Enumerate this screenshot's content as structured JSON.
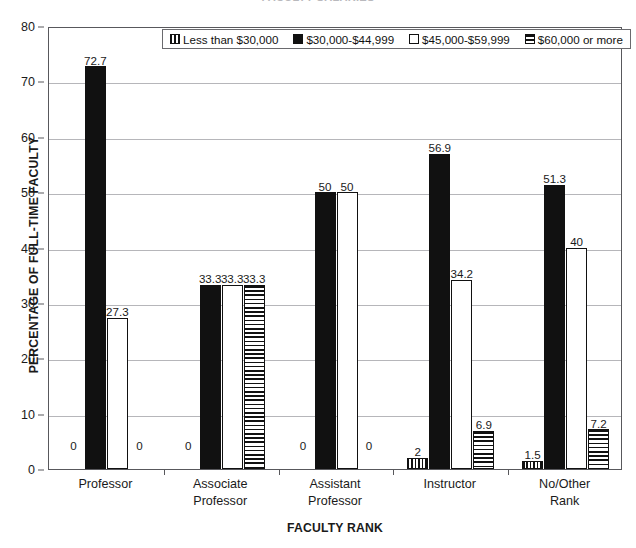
{
  "chart_data": {
    "type": "bar",
    "title": "FACULTY SALARIES",
    "xlabel": "FACULTY RANK",
    "ylabel": "PERCENTAGE OF FULL-TIME FACULTY",
    "ylim": [
      0,
      80
    ],
    "ytick_step": 10,
    "yticks": [
      0,
      10,
      20,
      30,
      40,
      50,
      60,
      70,
      80
    ],
    "grid": true,
    "legend_position": "top-inside",
    "categories": [
      "Professor",
      "Associate Professor",
      "Assistant Professor",
      "Instructor",
      "No/Other Rank"
    ],
    "category_lines": [
      [
        "Professor"
      ],
      [
        "Associate",
        "Professor"
      ],
      [
        "Assistant",
        "Professor"
      ],
      [
        "Instructor"
      ],
      [
        "No/Other",
        "Rank"
      ]
    ],
    "series": [
      {
        "name": "Less than $30,000",
        "pattern": "vertical-stripes",
        "color": "#111111",
        "values": [
          0,
          0,
          0,
          2,
          1.5
        ],
        "labels": [
          "0",
          "0",
          "0",
          "2",
          "1.5"
        ]
      },
      {
        "name": "$30,000-$44,999",
        "pattern": "solid-black",
        "color": "#111111",
        "values": [
          72.7,
          33.3,
          50,
          56.9,
          51.3
        ],
        "labels": [
          "72.7",
          "33.3",
          "50",
          "56.9",
          "51.3"
        ]
      },
      {
        "name": "$45,000-$59,999",
        "pattern": "white",
        "color": "#ffffff",
        "values": [
          27.3,
          33.3,
          50,
          34.2,
          40
        ],
        "labels": [
          "27.3",
          "33.3",
          "50",
          "34.2",
          "40"
        ]
      },
      {
        "name": "$60,000 or more",
        "pattern": "horizontal-stripes",
        "color": "#111111",
        "values": [
          0,
          33.3,
          0,
          6.9,
          7.2
        ],
        "labels": [
          "0",
          "33.3",
          "0",
          "6.9",
          "7.2"
        ]
      }
    ]
  }
}
